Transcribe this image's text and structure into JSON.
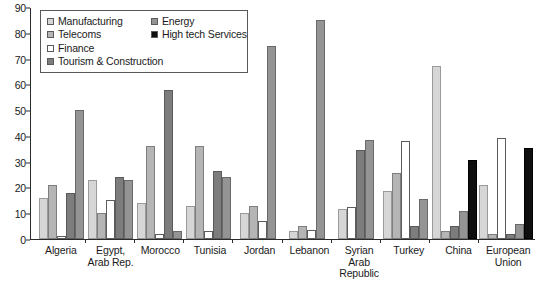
{
  "chart_data": {
    "type": "bar",
    "title": "",
    "subtitle": "",
    "xlabel": "",
    "ylabel": "",
    "ylim": [
      0,
      90
    ],
    "yticks": [
      0,
      10,
      20,
      30,
      40,
      50,
      60,
      70,
      80,
      90
    ],
    "grid": false,
    "legend_position": "top-left",
    "categories": [
      "Algeria",
      "Egypt,\nArab Rep.",
      "Morocco",
      "Tunisia",
      "Jordan",
      "Lebanon",
      "Syrian\nArab\nRepublic",
      "Turkey",
      "China",
      "European\nUnion"
    ],
    "series": [
      {
        "name": "Manufacturing",
        "color": "#d6d6d6",
        "values": [
          16,
          23,
          14,
          13,
          10,
          3,
          11.5,
          18.5,
          67,
          21
        ]
      },
      {
        "name": "Telecoms",
        "color": "#b5b5b5",
        "values": [
          21,
          10,
          36,
          36,
          13,
          5,
          null,
          25.5,
          3,
          2
        ]
      },
      {
        "name": "Finance",
        "color": "#ffffff",
        "values": [
          1,
          15,
          2,
          3,
          7,
          3.5,
          12.5,
          38,
          null,
          39
        ]
      },
      {
        "name": "Tourism & Construction",
        "color": "#7d7d7d",
        "values": [
          18,
          24,
          58,
          26.5,
          null,
          null,
          34.5,
          5,
          5,
          2
        ]
      },
      {
        "name": "Energy",
        "color": "#949494",
        "values": [
          50,
          23,
          3,
          24,
          75,
          85,
          38.5,
          15.5,
          11,
          6
        ]
      },
      {
        "name": "High tech Services",
        "color": "#0f0f0f",
        "values": [
          null,
          null,
          null,
          null,
          null,
          null,
          null,
          null,
          30.5,
          35.5
        ]
      }
    ]
  },
  "legend": {
    "items": [
      {
        "label": "Manufacturing",
        "swatch": "#d6d6d6"
      },
      {
        "label": "Energy",
        "swatch": "#949494"
      },
      {
        "label": "Telecoms",
        "swatch": "#b5b5b5"
      },
      {
        "label": "High tech Services",
        "swatch": "#0f0f0f"
      },
      {
        "label": "Finance",
        "swatch": "#ffffff"
      },
      {
        "label": "Tourism & Construction",
        "swatch": "#7d7d7d"
      }
    ]
  }
}
